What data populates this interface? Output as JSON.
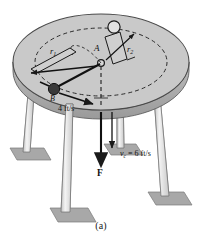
{
  "figure": {
    "caption": "(a)",
    "title_hidden": "",
    "labels": {
      "point_a": "A",
      "point_b": "B",
      "radius_1": "r",
      "radius_1_sub": "1",
      "radius_2": "r",
      "radius_2_sub": "2",
      "speed_table": "4 ft/s",
      "force": "F",
      "velocity_c_symbol": "v",
      "velocity_c_sub": "c",
      "velocity_c_value": "= 6 ft/s"
    },
    "colors": {
      "table_top": "#c9c9c9",
      "table_edge": "#b0b0b0",
      "table_rim_dark": "#8f8f8f",
      "leg_fill": "#ededed",
      "leg_shade": "#c2c2c2",
      "base_plate": "#a8a8a8",
      "ball_dark": "#3a3a3a",
      "ball_light": "#dedede",
      "line": "#1a1a1a",
      "dashed": "#2b2b2b",
      "background": "#ffffff"
    },
    "geometry_notes": {
      "table_center_x": 101,
      "table_center_y": 62,
      "table_rx": 88,
      "table_ry": 48,
      "hub_x": 101,
      "hub_y": 63,
      "leg_count": 4
    }
  }
}
